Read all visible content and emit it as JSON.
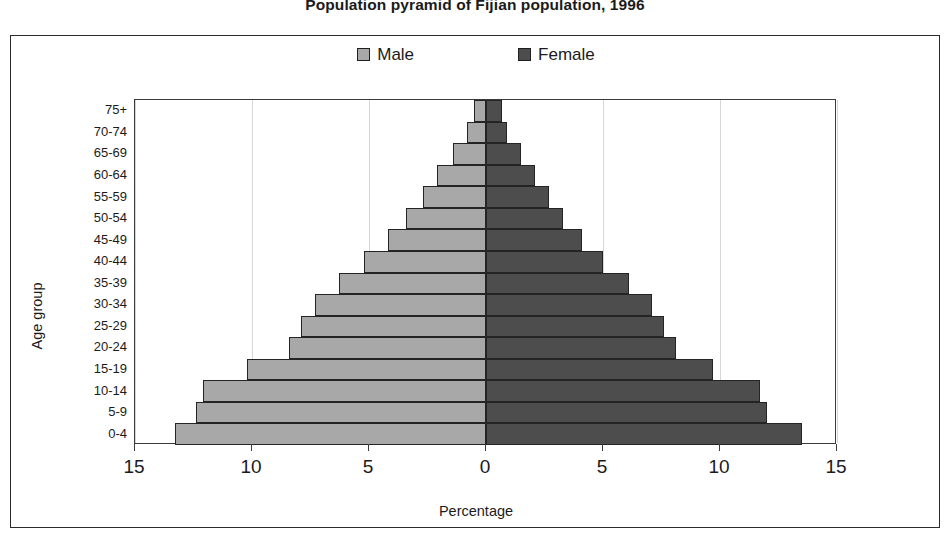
{
  "chart_data": {
    "type": "bar",
    "subtype": "population-pyramid",
    "title": "Population pyramid of Fijian population, 1996",
    "xlabel": "Percentage",
    "ylabel": "Age group",
    "grid": true,
    "legend_position": "top-center",
    "xlim": [
      -15,
      15
    ],
    "xticks": [
      15,
      10,
      5,
      0,
      5,
      10,
      15
    ],
    "xtick_values": [
      -15,
      -10,
      -5,
      0,
      5,
      10,
      15
    ],
    "categories": [
      "75+",
      "70-74",
      "65-69",
      "60-64",
      "55-59",
      "50-54",
      "45-49",
      "40-44",
      "35-39",
      "30-34",
      "25-29",
      "20-24",
      "15-19",
      "10-14",
      "5-9",
      "0-4"
    ],
    "series": [
      {
        "name": "Male",
        "color": "#a8a8a8",
        "side": "left",
        "values": [
          0.5,
          0.8,
          1.4,
          2.1,
          2.7,
          3.4,
          4.2,
          5.2,
          6.3,
          7.3,
          7.9,
          8.4,
          10.2,
          12.1,
          12.4,
          13.3
        ]
      },
      {
        "name": "Female",
        "color": "#4d4d4d",
        "side": "right",
        "values": [
          0.7,
          0.9,
          1.5,
          2.1,
          2.7,
          3.3,
          4.1,
          5.0,
          6.1,
          7.1,
          7.6,
          8.1,
          9.7,
          11.7,
          12.0,
          13.5
        ]
      }
    ]
  },
  "legend": {
    "items": [
      {
        "label": "Male",
        "color": "#a8a8a8"
      },
      {
        "label": "Female",
        "color": "#4d4d4d"
      }
    ]
  },
  "axes": {
    "y_title": "Age group",
    "x_title": "Percentage"
  }
}
